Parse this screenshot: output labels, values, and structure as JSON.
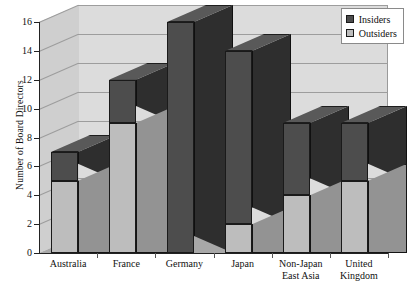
{
  "chart_data": {
    "type": "bar",
    "subtype": "stacked-3d-column",
    "title": "",
    "xlabel": "",
    "ylabel": "Number of Board Directors",
    "ylim": [
      0,
      16
    ],
    "ytick_step": 2,
    "yticks": [
      0,
      2,
      4,
      6,
      8,
      10,
      12,
      14,
      16
    ],
    "ytick_labels": [
      "0",
      "2",
      "4",
      "6",
      "8",
      "10",
      "12",
      "14",
      "16"
    ],
    "grid": true,
    "legend_position": "top-right",
    "categories": [
      "Australia",
      "France",
      "Germany",
      "Japan",
      "Non-Japan\nEast Asia",
      "United\nKingdom"
    ],
    "series": [
      {
        "name": "Outsiders",
        "color": "#bdbdbd",
        "values": [
          5,
          9,
          0,
          2,
          4,
          5
        ]
      },
      {
        "name": "Insiders",
        "color": "#4d4d4d",
        "values": [
          2,
          3,
          16,
          12,
          5,
          4
        ]
      }
    ],
    "totals": [
      7,
      12,
      16,
      14,
      9,
      9
    ],
    "stack_order": [
      "Outsiders",
      "Insiders"
    ]
  },
  "legend": {
    "items": [
      {
        "label": "Insiders",
        "color": "#4d4d4d"
      },
      {
        "label": "Outsiders",
        "color": "#bdbdbd"
      }
    ]
  },
  "colors": {
    "insiders": "#4d4d4d",
    "outsiders": "#bdbdbd",
    "plot_background": "#dcdcdc",
    "side_wall": "#cfcfcf",
    "floor": "#a8a8a8",
    "axis": "#222222",
    "gridline": "#9d9d9d"
  }
}
